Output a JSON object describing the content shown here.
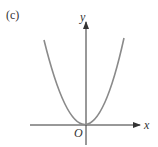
{
  "figure": {
    "panel_label": "(c)",
    "x_label": "x",
    "y_label": "y",
    "origin_label": "O",
    "curve": "parabola opening upward with vertex at origin",
    "colors": {
      "curve": "#8a8a8a",
      "axes": "#333333"
    }
  }
}
